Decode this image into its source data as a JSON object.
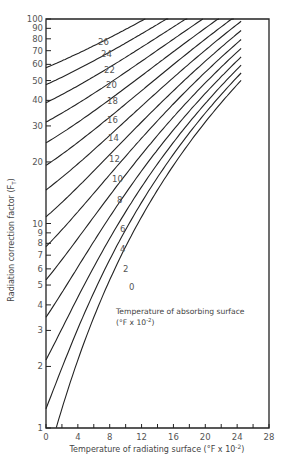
{
  "chart_data": {
    "type": "line",
    "title": "",
    "xlabel": "Temperature of radiating surface (°F x 10^-2)",
    "ylabel": "Radiation correction factor (F_T)",
    "xlim": [
      0,
      28
    ],
    "ylim": [
      1,
      100
    ],
    "yscale": "log",
    "grid": false,
    "x_ticks": [
      0,
      4,
      8,
      12,
      16,
      20,
      24,
      28
    ],
    "x_minor_ticks": [
      2,
      6,
      10,
      14,
      18,
      22,
      26
    ],
    "y_tick_labels": [
      1,
      2,
      3,
      4,
      5,
      6,
      7,
      8,
      9,
      10,
      20,
      30,
      40,
      50,
      60,
      70,
      80,
      90,
      100
    ],
    "annotation": {
      "line1": "Temperature of absorbing surface",
      "line2": "(°F x 10^-2)"
    },
    "series_parameter": "Temperature of absorbing surface (°F x 10^-2)",
    "series": [
      {
        "name": "0",
        "x": [
          1,
          4,
          8,
          12,
          16,
          20,
          24.5
        ],
        "values": [
          1.0,
          1.4,
          2.5,
          4.3,
          8.3,
          18.4,
          45.0
        ]
      },
      {
        "name": "2",
        "x": [
          0,
          4,
          8,
          12,
          16,
          20,
          24.5
        ],
        "values": [
          1.2,
          1.9,
          3.4,
          6.0,
          10.6,
          21.0,
          49.0
        ]
      },
      {
        "name": "4",
        "x": [
          0,
          4,
          8,
          12,
          16,
          20,
          24.5
        ],
        "values": [
          1.7,
          2.6,
          4.3,
          7.3,
          12.4,
          23.5,
          53.0
        ]
      },
      {
        "name": "6",
        "x": [
          0,
          4,
          8,
          12,
          16,
          20,
          24.5
        ],
        "values": [
          2.4,
          3.5,
          5.4,
          8.6,
          14.2,
          26.0,
          57.0
        ]
      },
      {
        "name": "8",
        "x": [
          0,
          4,
          8,
          12,
          16,
          20,
          24.5
        ],
        "values": [
          3.5,
          4.7,
          6.9,
          10.6,
          16.6,
          29.0,
          62.0
        ]
      },
      {
        "name": "10",
        "x": [
          0,
          4,
          8,
          12,
          16,
          20,
          24.5
        ],
        "values": [
          5.4,
          6.6,
          9.2,
          13.2,
          19.6,
          32.5,
          67.0
        ]
      },
      {
        "name": "12",
        "x": [
          0,
          4,
          8,
          12,
          16,
          20,
          24.5
        ],
        "values": [
          7.8,
          9.2,
          12.0,
          16.5,
          23.5,
          37.0,
          72.0
        ]
      },
      {
        "name": "14",
        "x": [
          0,
          4,
          8,
          12,
          16,
          20,
          24.5
        ],
        "values": [
          11.0,
          12.5,
          15.6,
          20.5,
          28.0,
          42.0,
          78.0
        ]
      },
      {
        "name": "16",
        "x": [
          0,
          4,
          8,
          12,
          16,
          20,
          24.5
        ],
        "values": [
          15.1,
          16.8,
          20.1,
          25.3,
          33.3,
          48.0,
          85.0
        ]
      },
      {
        "name": "18",
        "x": [
          0,
          4,
          8,
          12,
          16,
          20,
          23.5
        ],
        "values": [
          20.4,
          22.3,
          25.8,
          31.3,
          39.7,
          55.0,
          87.0
        ]
      },
      {
        "name": "20",
        "x": [
          0,
          4,
          8,
          12,
          16,
          20,
          22.5
        ],
        "values": [
          27.0,
          29.0,
          32.7,
          38.5,
          47.3,
          63.0,
          85.0
        ]
      },
      {
        "name": "22",
        "x": [
          0,
          4,
          8,
          12,
          16,
          20,
          21.5
        ],
        "values": [
          35.0,
          37.1,
          41.0,
          47.1,
          56.2,
          72.0,
          90.0
        ]
      },
      {
        "name": "24",
        "x": [
          0,
          4,
          8,
          12,
          16,
          19.5
        ],
        "values": [
          44.8,
          47.0,
          51.0,
          57.3,
          66.7,
          100.0
        ]
      },
      {
        "name": "26",
        "x": [
          0,
          4,
          8,
          12,
          16,
          17.5
        ],
        "values": [
          56.5,
          58.8,
          63.0,
          69.5,
          79.2,
          100.0
        ]
      }
    ]
  }
}
